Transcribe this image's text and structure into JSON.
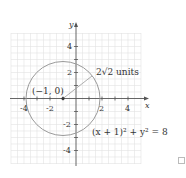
{
  "diagram": {
    "type": "circle-graph",
    "axes": {
      "x_label": "x",
      "y_label": "y",
      "x_ticks": [
        "-4",
        "-2",
        "2",
        "4"
      ],
      "y_ticks": [
        "4",
        "2",
        "-2",
        "-4"
      ],
      "range": [
        -5,
        5
      ]
    },
    "circle": {
      "center_label": "(−1, 0)",
      "center": [
        -1,
        0
      ],
      "radius_label": "2√2 units",
      "radius": 2.828,
      "equation": "(x + 1)² + y² = 8",
      "color": "#999999"
    },
    "grid_color": "#dddddd",
    "axis_color": "#555555"
  }
}
